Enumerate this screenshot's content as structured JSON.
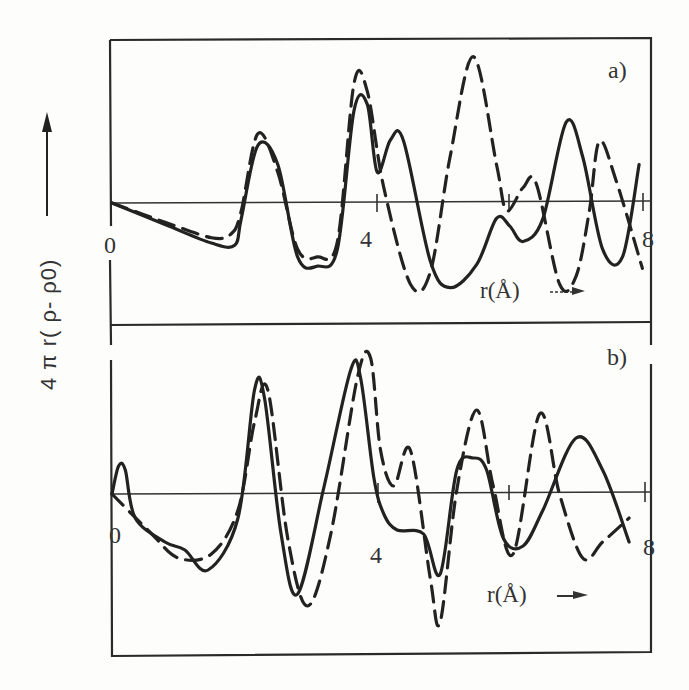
{
  "chart_data": {
    "type": "line",
    "ylabel": "4 π r( ρ- ρ0)",
    "xlabel": "r(Å)",
    "x_ticks": [
      "0",
      "4",
      "8"
    ],
    "xlim": [
      0,
      8
    ],
    "legend": [
      {
        "name": "solid",
        "style": "solid"
      },
      {
        "name": "dashed",
        "style": "dashed"
      }
    ],
    "panels": [
      {
        "label": "a)",
        "series": [
          {
            "name": "solid",
            "style": "solid",
            "x": [
              0,
              0.8,
              1.5,
              1.85,
              1.95,
              2.2,
              2.5,
              2.8,
              3.1,
              3.4,
              3.65,
              3.85,
              4.0,
              4.2,
              4.4,
              4.8,
              5.1,
              5.5,
              5.8,
              6.0,
              6.2,
              6.5,
              6.85,
              7.1,
              7.4,
              7.7,
              7.95
            ],
            "y": [
              0,
              -0.28,
              -0.52,
              -0.55,
              -0.2,
              0.75,
              0.5,
              -0.7,
              -0.82,
              -0.6,
              1.2,
              1.28,
              0.4,
              0.82,
              0.8,
              -0.75,
              -1.1,
              -0.8,
              -0.2,
              -0.3,
              -0.5,
              -0.2,
              1.05,
              0.6,
              -0.6,
              -0.7,
              0.5
            ]
          },
          {
            "name": "dashed",
            "style": "dashed",
            "x": [
              0,
              0.8,
              1.5,
              1.8,
              1.95,
              2.2,
              2.5,
              2.8,
              3.1,
              3.4,
              3.65,
              3.85,
              4.1,
              4.5,
              4.8,
              5.1,
              5.45,
              5.8,
              5.95,
              6.2,
              6.4,
              6.75,
              7.0,
              7.2,
              7.35,
              7.6,
              8.0
            ],
            "y": [
              0,
              -0.25,
              -0.45,
              -0.4,
              -0.1,
              0.9,
              0.4,
              -0.6,
              -0.7,
              -0.5,
              1.55,
              1.45,
              0.2,
              -1.05,
              -0.9,
              0.6,
              1.9,
              0.5,
              -0.1,
              0.2,
              0.25,
              -1.05,
              -0.95,
              -0.1,
              0.8,
              0.3,
              -0.85
            ]
          }
        ]
      },
      {
        "label": "b)",
        "series": [
          {
            "name": "solid",
            "style": "solid",
            "x": [
              0,
              0.1,
              0.2,
              0.35,
              0.8,
              1.1,
              1.45,
              1.9,
              2.15,
              2.3,
              2.55,
              2.8,
              3.2,
              3.6,
              3.75,
              3.95,
              4.1,
              4.3,
              4.7,
              4.95,
              5.2,
              5.45,
              5.65,
              5.9,
              6.2,
              6.5,
              7.0,
              7.4,
              7.8
            ],
            "y": [
              0,
              0.35,
              0.3,
              -0.3,
              -0.6,
              -0.7,
              -0.95,
              -0.3,
              1.3,
              1.2,
              -0.5,
              -1.25,
              0.1,
              1.55,
              1.45,
              0.2,
              -0.25,
              -0.45,
              -0.5,
              -1.0,
              0.3,
              0.45,
              0.3,
              -0.55,
              -0.65,
              -0.2,
              0.7,
              0.3,
              -0.6
            ]
          },
          {
            "name": "dashed",
            "style": "dashed",
            "x": [
              0,
              0.6,
              1.0,
              1.5,
              1.9,
              2.15,
              2.35,
              2.65,
              2.95,
              3.3,
              3.7,
              3.9,
              4.05,
              4.25,
              4.5,
              4.8,
              4.95,
              5.2,
              5.5,
              5.75,
              6.05,
              6.45,
              6.75,
              7.1,
              7.4,
              7.8
            ],
            "y": [
              0,
              -0.5,
              -0.8,
              -0.75,
              -0.2,
              0.9,
              1.3,
              -0.55,
              -1.4,
              -0.5,
              1.45,
              1.7,
              0.55,
              0.1,
              0.55,
              -1.05,
              -1.6,
              0.05,
              1.05,
              0.1,
              -0.75,
              1.0,
              0.0,
              -0.8,
              -0.6,
              -0.3
            ]
          }
        ]
      }
    ]
  }
}
